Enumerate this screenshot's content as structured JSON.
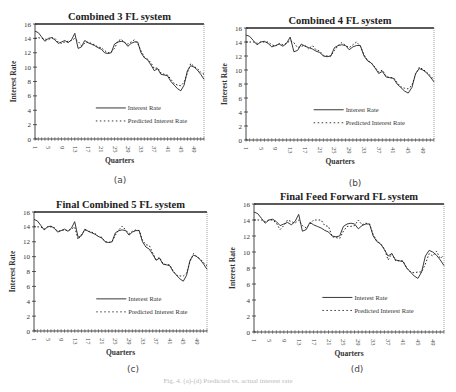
{
  "figure": {
    "caption": "Fig. 4. (a)-(d) Predicted vs. actual interest rate",
    "panels": [
      {
        "letter": "(a)",
        "title": "Combined 3 FL system"
      },
      {
        "letter": "(b)",
        "title": "Combined 4 FL system"
      },
      {
        "letter": "(c)",
        "title": "Final Combined 5 FL system"
      },
      {
        "letter": "(d)",
        "title": "Final Feed Forward FL system"
      }
    ]
  },
  "chart_data": [
    {
      "type": "line",
      "title": "Combined 3 FL system",
      "xlabel": "Quarters",
      "ylabel": "Interest Rate",
      "ylim": [
        0,
        16
      ],
      "yticks": [
        0,
        2,
        4,
        6,
        8,
        10,
        12,
        14,
        16
      ],
      "xtick_labels": [
        "1",
        "5",
        "9",
        "13",
        "17",
        "21",
        "25",
        "29",
        "33",
        "37",
        "41",
        "45",
        "49"
      ],
      "x_range": [
        1,
        52
      ],
      "grid": false,
      "legend_position": "lower right inside",
      "series": [
        {
          "name": "Interest Rate",
          "style": "solid",
          "values": [
            15.0,
            14.8,
            14.2,
            13.6,
            14.0,
            14.1,
            13.8,
            13.3,
            13.5,
            13.7,
            13.4,
            13.8,
            14.7,
            12.6,
            12.8,
            13.7,
            13.4,
            13.2,
            13.0,
            12.7,
            12.5,
            12.0,
            11.9,
            12.0,
            13.2,
            13.5,
            13.6,
            13.5,
            12.9,
            13.3,
            13.5,
            13.5,
            12.0,
            11.3,
            11.0,
            10.3,
            9.5,
            9.8,
            9.0,
            8.9,
            8.8,
            8.0,
            7.5,
            7.0,
            6.7,
            7.5,
            9.5,
            10.2,
            10.0,
            9.6,
            9.0,
            8.3
          ]
        },
        {
          "name": "Predicted Interest Rate",
          "style": "dashed",
          "values": [
            14.0,
            14.1,
            14.0,
            13.9,
            13.8,
            14.1,
            14.0,
            13.5,
            13.3,
            13.5,
            13.6,
            13.7,
            14.0,
            13.6,
            13.0,
            13.3,
            13.5,
            13.3,
            13.1,
            12.8,
            12.7,
            12.3,
            12.0,
            12.1,
            12.6,
            13.6,
            13.9,
            13.4,
            13.2,
            13.5,
            13.8,
            13.3,
            12.3,
            11.4,
            11.1,
            10.6,
            9.8,
            9.9,
            9.2,
            9.0,
            8.9,
            8.3,
            7.7,
            7.5,
            7.4,
            7.9,
            9.2,
            10.5,
            10.1,
            9.8,
            9.3,
            9.0
          ]
        }
      ]
    },
    {
      "type": "line",
      "title": "Combined 4 FL system",
      "xlabel": "Quarters",
      "ylabel": "Interest Rate",
      "ylim": [
        0,
        16
      ],
      "yticks": [
        0,
        2,
        4,
        6,
        8,
        10,
        12,
        14,
        16
      ],
      "xtick_labels": [
        "1",
        "5",
        "9",
        "13",
        "17",
        "21",
        "25",
        "29",
        "33",
        "37",
        "41",
        "45",
        "49"
      ],
      "x_range": [
        1,
        52
      ],
      "grid": false,
      "legend_position": "lower right inside",
      "series": [
        {
          "name": "Interest Rate",
          "style": "solid",
          "values": [
            15.0,
            14.8,
            14.2,
            13.6,
            14.0,
            14.1,
            13.8,
            13.3,
            13.5,
            13.7,
            13.4,
            13.8,
            14.7,
            12.6,
            12.8,
            13.7,
            13.4,
            13.2,
            13.0,
            12.7,
            12.5,
            12.0,
            11.9,
            12.0,
            13.2,
            13.5,
            13.6,
            13.5,
            12.9,
            13.3,
            13.5,
            13.5,
            12.0,
            11.3,
            11.0,
            10.3,
            9.5,
            9.8,
            9.0,
            8.9,
            8.8,
            8.0,
            7.5,
            7.0,
            6.7,
            7.5,
            9.5,
            10.2,
            10.0,
            9.6,
            9.0,
            8.3
          ]
        },
        {
          "name": "Predicted Interest Rate",
          "style": "dashed",
          "values": [
            14.0,
            14.0,
            14.0,
            13.8,
            14.0,
            14.0,
            14.0,
            13.6,
            13.4,
            13.8,
            13.6,
            13.8,
            14.2,
            13.9,
            13.2,
            13.4,
            13.5,
            13.0,
            13.5,
            12.9,
            12.7,
            12.1,
            12.0,
            12.0,
            12.8,
            13.5,
            13.9,
            13.5,
            13.2,
            13.6,
            14.0,
            13.4,
            12.2,
            11.4,
            11.0,
            10.4,
            9.7,
            10.0,
            9.1,
            8.9,
            8.9,
            8.2,
            7.6,
            7.4,
            7.3,
            7.8,
            9.4,
            10.4,
            10.1,
            9.7,
            9.2,
            8.6
          ]
        }
      ]
    },
    {
      "type": "line",
      "title": "Final Combined 5 FL system",
      "xlabel": "Quarters",
      "ylabel": "Interest Rate",
      "ylim": [
        0,
        16
      ],
      "yticks": [
        0,
        2,
        4,
        6,
        8,
        10,
        12,
        14,
        16
      ],
      "xtick_labels": [
        "1",
        "5",
        "9",
        "13",
        "17",
        "21",
        "25",
        "29",
        "33",
        "37",
        "41",
        "45",
        "49"
      ],
      "x_range": [
        1,
        52
      ],
      "grid": false,
      "legend_position": "lower right inside",
      "series": [
        {
          "name": "Interest Rate",
          "style": "solid",
          "values": [
            15.0,
            14.8,
            14.2,
            13.6,
            14.0,
            14.1,
            13.8,
            13.3,
            13.5,
            13.7,
            13.4,
            13.8,
            14.7,
            12.6,
            12.8,
            13.7,
            13.4,
            13.2,
            13.0,
            12.7,
            12.5,
            12.0,
            11.9,
            12.0,
            13.2,
            13.5,
            13.6,
            13.5,
            12.9,
            13.3,
            13.5,
            13.5,
            12.0,
            11.3,
            11.0,
            10.3,
            9.5,
            9.8,
            9.0,
            8.9,
            8.8,
            8.0,
            7.5,
            7.0,
            6.7,
            7.5,
            9.5,
            10.2,
            10.0,
            9.6,
            9.0,
            8.3
          ]
        },
        {
          "name": "Predicted Interest Rate",
          "style": "dashed",
          "values": [
            14.1,
            14.0,
            14.0,
            13.7,
            14.0,
            14.0,
            13.9,
            13.4,
            13.5,
            13.6,
            13.5,
            13.7,
            14.0,
            12.3,
            13.0,
            13.6,
            13.4,
            13.3,
            13.1,
            12.7,
            12.6,
            12.0,
            11.9,
            12.0,
            12.9,
            13.6,
            14.1,
            13.6,
            13.1,
            13.4,
            13.6,
            13.5,
            12.2,
            11.6,
            11.5,
            10.5,
            9.6,
            9.9,
            9.1,
            8.9,
            8.9,
            8.1,
            7.5,
            7.4,
            7.4,
            7.8,
            9.3,
            10.4,
            10.0,
            9.7,
            9.2,
            8.8
          ]
        }
      ]
    },
    {
      "type": "line",
      "title": "Final Feed Forward FL system",
      "xlabel": "Quarters",
      "ylabel": "Interest Rate",
      "ylim": [
        0,
        16
      ],
      "yticks": [
        0,
        2,
        4,
        6,
        8,
        10,
        12,
        14,
        16
      ],
      "xtick_labels": [
        "1",
        "5",
        "9",
        "13",
        "17",
        "21",
        "25",
        "29",
        "33",
        "37",
        "41",
        "45",
        "49"
      ],
      "x_range": [
        1,
        52
      ],
      "grid": false,
      "legend_position": "lower right inside",
      "series": [
        {
          "name": "Interest Rate",
          "style": "solid",
          "values": [
            15.0,
            14.8,
            14.2,
            13.6,
            14.0,
            14.1,
            13.8,
            13.3,
            13.5,
            13.7,
            13.4,
            13.8,
            14.7,
            12.6,
            12.8,
            13.7,
            13.4,
            13.2,
            13.0,
            12.7,
            12.5,
            12.0,
            11.9,
            12.0,
            13.2,
            13.5,
            13.6,
            13.5,
            12.9,
            13.3,
            13.5,
            13.5,
            12.0,
            11.3,
            11.0,
            10.3,
            9.5,
            9.8,
            9.0,
            8.9,
            8.8,
            8.0,
            7.5,
            7.0,
            6.7,
            7.5,
            9.5,
            10.2,
            10.0,
            9.6,
            9.0,
            8.3
          ]
        },
        {
          "name": "Predicted Interest Rate",
          "style": "dashed",
          "values": [
            14.0,
            14.0,
            14.0,
            13.8,
            14.0,
            14.0,
            13.6,
            12.8,
            13.3,
            14.0,
            13.8,
            13.6,
            14.0,
            13.3,
            13.0,
            13.5,
            14.0,
            14.0,
            14.0,
            13.3,
            13.2,
            11.9,
            11.8,
            11.7,
            12.6,
            13.2,
            13.2,
            13.3,
            14.0,
            13.4,
            13.6,
            13.5,
            12.2,
            11.4,
            11.0,
            10.4,
            9.0,
            9.8,
            8.9,
            8.9,
            8.9,
            8.0,
            7.5,
            7.4,
            7.5,
            7.5,
            8.5,
            9.8,
            9.5,
            10.1,
            9.2,
            9.6
          ]
        }
      ]
    }
  ]
}
